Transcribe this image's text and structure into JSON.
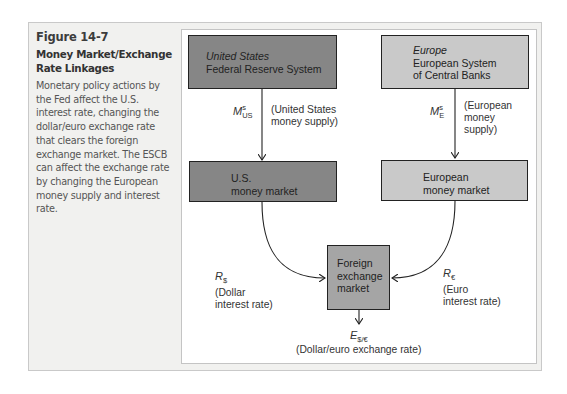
{
  "caption": {
    "figure_number": "Figure 14-7",
    "title": "Money Market/Exchange Rate Linkages",
    "body": "Monetary policy actions by the Fed affect the U.S. interest rate, changing the dollar/euro exchange rate that clears the foreign exchange market. The ESCB can affect the exchange rate by changing the European money supply and interest rate."
  },
  "diagram": {
    "us_central_bank": {
      "region": "United States",
      "name": "Federal Reserve System"
    },
    "eu_central_bank": {
      "region": "Europe",
      "name_line1": "European System",
      "name_line2": "of Central Banks"
    },
    "us_money_supply": {
      "symbol": "M",
      "sup": "s",
      "sub": "US",
      "desc_line1": "(United States",
      "desc_line2": "money supply)"
    },
    "eu_money_supply": {
      "symbol": "M",
      "sup": "s",
      "sub": "E",
      "desc_line1": "(European",
      "desc_line2": "money",
      "desc_line3": "supply)"
    },
    "us_money_market": {
      "line1": "U.S.",
      "line2": "money market"
    },
    "eu_money_market": {
      "line1": "European",
      "line2": "money market"
    },
    "dollar_rate": {
      "symbol": "R",
      "sub": "$",
      "desc_line1": "(Dollar",
      "desc_line2": "interest rate)"
    },
    "euro_rate": {
      "symbol": "R",
      "sub": "€",
      "desc_line1": "(Euro",
      "desc_line2": "interest rate)"
    },
    "fx_market": {
      "line1": "Foreign",
      "line2": "exchange",
      "line3": "market"
    },
    "exchange_rate": {
      "symbol": "E",
      "sub": "$/€",
      "desc": "(Dollar/euro exchange rate)"
    }
  },
  "colors": {
    "us_box": "#868686",
    "eu_box": "#c9c9c9",
    "fx_box": "#a5a5a5",
    "frame_bg": "#f1f1ef"
  }
}
